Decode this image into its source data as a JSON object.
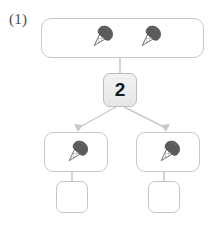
{
  "problem": {
    "label": "(1)",
    "type": "division-grouping-diagram"
  },
  "diagram": {
    "top_group": {
      "name": "total-group",
      "item_icon": "ice-cream-cone-icon",
      "item_count": 2,
      "items": [
        "ice-cream-cone-icon",
        "ice-cream-cone-icon"
      ]
    },
    "operator": {
      "name": "divisor-box",
      "value": "2"
    },
    "branches": [
      {
        "name": "group-left",
        "item_icon": "ice-cream-cone-icon",
        "item_count": 1,
        "answer_value": ""
      },
      {
        "name": "group-right",
        "item_icon": "ice-cream-cone-icon",
        "item_count": 1,
        "answer_value": ""
      }
    ]
  },
  "colors": {
    "box_border": "#c8c8c8",
    "answer_border": "#c4c4c4",
    "count_box_fill": "#ececec",
    "count_box_border": "#bdbdbd",
    "connector": "#c9c9c9",
    "label_text": "#4a4a4a",
    "count_text": "#1a1a1a",
    "cone_scoop": "#595959",
    "cone_body": "#8a8a8a",
    "background": "#ffffff"
  }
}
